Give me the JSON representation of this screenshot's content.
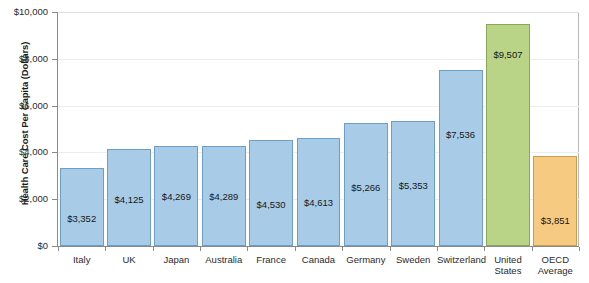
{
  "chart_data": {
    "type": "bar",
    "title": "",
    "xlabel": "",
    "ylabel": "Health Care Cost Per Capita (Dollars)",
    "ylim": [
      0,
      10000
    ],
    "ytick_values": [
      0,
      2000,
      4000,
      6000,
      8000,
      10000
    ],
    "ytick_labels": [
      "$0",
      "$2,000",
      "$4,000",
      "$6,000",
      "$8,000",
      "$10,000"
    ],
    "grid": true,
    "legend": "none",
    "categories": [
      "Italy",
      "UK",
      "Japan",
      "Australia",
      "France",
      "Canada",
      "Germany",
      "Sweden",
      "Switzerland",
      "United States",
      "OECD Average"
    ],
    "values": [
      3352,
      4125,
      4269,
      4289,
      4530,
      4613,
      5266,
      5353,
      7536,
      9507,
      3851
    ],
    "value_labels": [
      "$3,352",
      "$4,125",
      "$4,269",
      "$4,289",
      "$4,530",
      "$4,613",
      "$5,266",
      "$5,353",
      "$7,536",
      "$9,507",
      "$3,851"
    ],
    "bar_colors": [
      "#a8cce8",
      "#a8cce8",
      "#a8cce8",
      "#a8cce8",
      "#a8cce8",
      "#a8cce8",
      "#a8cce8",
      "#a8cce8",
      "#a8cce8",
      "#b9d486",
      "#f6ca80"
    ],
    "bar_border_colors": [
      "#6f9ec4",
      "#6f9ec4",
      "#6f9ec4",
      "#6f9ec4",
      "#6f9ec4",
      "#6f9ec4",
      "#6f9ec4",
      "#6f9ec4",
      "#6f9ec4",
      "#8aa85c",
      "#c99c4e"
    ],
    "label_offsets_from_top": [
      44,
      44,
      44,
      44,
      58,
      58,
      58,
      58,
      58,
      24,
      58
    ],
    "colors": {
      "blue_fill": "#a8cce8",
      "blue_border": "#6f9ec4",
      "green_fill": "#b9d486",
      "green_border": "#8aa85c",
      "orange_fill": "#f6ca80",
      "orange_border": "#c99c4e",
      "gridline": "#ededed",
      "axis": "#8a8a8a",
      "text": "#2b2b2b",
      "background": "#ffffff"
    }
  }
}
